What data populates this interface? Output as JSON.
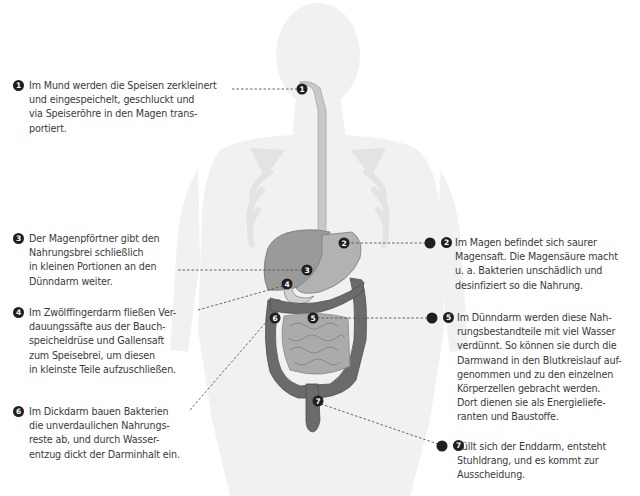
{
  "diagram": {
    "colors": {
      "text": "#3a3a3a",
      "marker": "#1f1f1f",
      "body_silhouette": "#f0f0f0",
      "skeleton": "#e2e2e2",
      "organ_light": "#b5b5b5",
      "organ_mid": "#8f8f8f",
      "organ_dark": "#5f5f5f",
      "leader_line": "#555555"
    },
    "callouts": [
      {
        "number": "1",
        "text": "Im Mund werden die Speisen zerkleinert\nund eingespeichelt, geschluckt und\nvia Speiseröhre in den Magen trans-\nportiert."
      },
      {
        "number": "2",
        "text": "Im Magen befindet sich saurer\nMagensaft. Die Magensäure macht\nu. a. Bakterien unschädlich und\ndesinfiziert so die Nahrung."
      },
      {
        "number": "3",
        "text": "Der Magenpförtner gibt den\nNahrungsbrei schließlich\nin kleinen Portionen an den\nDünndarm weiter."
      },
      {
        "number": "4",
        "text": "Im Zwölffingerdarm fließen Ver-\ndauungssäfte aus der Bauch-\nspeicheldrüse und Gallensaft\nzum Speisebrei, um diesen\nin kleinste Teile aufzuschließen."
      },
      {
        "number": "5",
        "text": "Im Dünndarm werden diese Nah-\nrungsbestandteile mit viel Wasser\nverdünnt. So können sie durch die\nDarmwand in den Blutkreislauf auf-\ngenommen und zu den einzelnen\nKörperzellen gebracht werden.\nDort dienen sie als Energieliefe-\nranten und Baustoffe."
      },
      {
        "number": "6",
        "text": "Im Dickdarm bauen Bakterien\ndie unverdaulichen Nahrungs-\nreste ab, und durch Wasser-\nentzug dickt der Darminhalt ein."
      },
      {
        "number": "7",
        "text": "Füllt sich der Enddarm, entsteht\nStuhldrang, und es kommt zur\nAusscheidung."
      }
    ],
    "markers": [
      {
        "number": "1"
      },
      {
        "number": "2"
      },
      {
        "number": "3"
      },
      {
        "number": "4"
      },
      {
        "number": "5"
      },
      {
        "number": "6"
      },
      {
        "number": "7"
      }
    ]
  }
}
